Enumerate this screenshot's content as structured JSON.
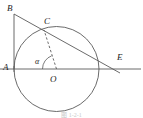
{
  "figure": {
    "caption": "图 1-2-1",
    "background_color": "#ffffff",
    "stroke_color": "#5a5a5a",
    "label_color": "#1d1d1d",
    "labels": [
      {
        "id": "B",
        "text": "B",
        "x": 7,
        "y": 4
      },
      {
        "id": "C",
        "text": "C",
        "x": 44,
        "y": 17
      },
      {
        "id": "E",
        "text": "E",
        "x": 117,
        "y": 53
      },
      {
        "id": "A",
        "text": "A",
        "x": 3,
        "y": 63
      },
      {
        "id": "alpha",
        "text": "α",
        "x": 35,
        "y": 57
      },
      {
        "id": "O",
        "text": "O",
        "x": 50,
        "y": 75
      }
    ],
    "points": {
      "A": {
        "x": 14,
        "y": 69
      },
      "B": {
        "x": 14,
        "y": 14
      },
      "C": {
        "x": 44,
        "y": 30
      },
      "E": {
        "x": 114,
        "y": 69
      },
      "O": {
        "x": 56.5,
        "y": 69
      }
    },
    "circle": {
      "cx": 56.5,
      "cy": 69,
      "r": 42.5
    },
    "segments": [
      {
        "id": "AB",
        "name": "segment-ab",
        "x1": 14,
        "y1": 14,
        "x2": 14,
        "y2": 69,
        "dashed": false
      },
      {
        "id": "BE",
        "name": "segment-be",
        "x1": 14,
        "y1": 14,
        "x2": 120,
        "y2": 73,
        "dashed": false
      },
      {
        "id": "AE-axis",
        "name": "horizontal-axis",
        "x1": 0,
        "y1": 69,
        "x2": 141,
        "y2": 69,
        "dashed": false
      },
      {
        "id": "OC",
        "name": "segment-oc-dashed",
        "x1": 56.5,
        "y1": 69,
        "x2": 44,
        "y2": 30,
        "dashed": true
      }
    ],
    "angle_arc": {
      "id": "alpha-arc",
      "name": "angle-alpha-arc",
      "vertex": {
        "x": 56.5,
        "y": 69
      },
      "radius": 14,
      "from_deg": 180,
      "to_deg": 252
    }
  }
}
